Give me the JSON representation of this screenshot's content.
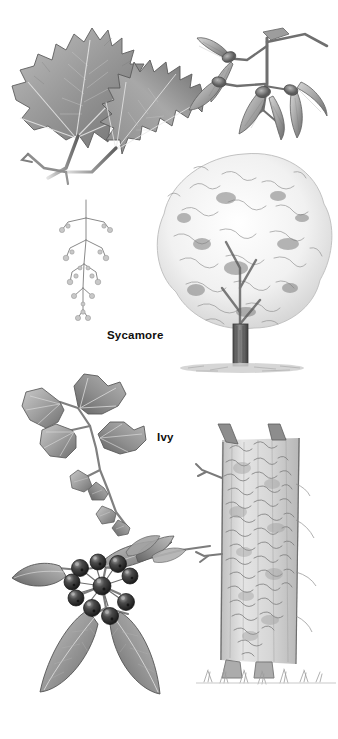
{
  "plate": {
    "kind": "botanical-illustration-plate",
    "medium": "graphite pencil drawing, grayscale",
    "background_color": "#ffffff",
    "width": 338,
    "height": 739,
    "label_color": "#100f0d"
  },
  "labels": [
    {
      "id": "sycamore",
      "text": "Sycamore",
      "x": 107,
      "y": 330
    },
    {
      "id": "ivy",
      "text": "Ivy",
      "x": 157,
      "y": 432
    }
  ],
  "species": [
    {
      "id": "sycamore",
      "common_name": "Sycamore",
      "label": "Sycamore",
      "section": "top",
      "parts": [
        {
          "name": "compound-leaf-spray",
          "description": "two large five-lobed maple-like leaves with toothed margins on a woody twig",
          "lobes": 5
        },
        {
          "name": "winged-seeds",
          "description": "paired winged samaras (keys) hanging in a cluster",
          "samara_pairs": 4
        },
        {
          "name": "flower-panicle",
          "description": "pendulous hanging flower raceme"
        },
        {
          "name": "whole-tree",
          "description": "broad domed crown tree with short stout trunk and ground shadow"
        }
      ]
    },
    {
      "id": "ivy",
      "common_name": "Ivy",
      "label": "Ivy",
      "section": "bottom",
      "parts": [
        {
          "name": "juvenile-leaves",
          "description": "palmate three to five lobed juvenile ivy leaves on a trailing stem"
        },
        {
          "name": "adult-leaves",
          "description": "entire elliptical adult ivy leaves"
        },
        {
          "name": "berry-cluster",
          "description": "umbel of dark round ripe berries",
          "berry_count": 10
        },
        {
          "name": "ivy-clad-trunk",
          "description": "tree trunk densely clothed in climbing ivy with grass tufts at the base"
        }
      ]
    }
  ],
  "palette": {
    "paper": "#ffffff",
    "ink_dark": "#3a3a3a",
    "leaf_mid": "#9a9a9a",
    "leaf_shadow": "#6b6b6b",
    "leaf_light": "#cfcfcf",
    "vein": "#e6e6e6",
    "berry_dark": "#2b2b2b",
    "berry_highlight": "#b5b5b5",
    "trunk": "#7d7d7d",
    "foliage_stipple": "#8c8c8c",
    "ground": "#b9b9b9"
  }
}
